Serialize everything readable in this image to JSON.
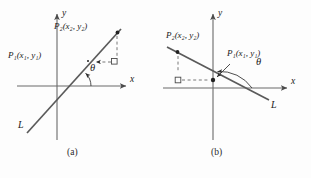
{
  "figure": {
    "background": "#fdfdfd",
    "stroke_color": "#5a5a5a",
    "text_color": "#1a1a1a",
    "width": 311,
    "height": 178
  },
  "panels": [
    {
      "id": "a",
      "caption": "(a)",
      "caption_pos": [
        74,
        152
      ],
      "description": "Line L with positive slope rising left to right; acute angle theta",
      "axes": {
        "x_label": "x",
        "y_label": "y",
        "x_label_pos": [
          131,
          80
        ],
        "y_label_pos": [
          62,
          12
        ],
        "x_axis": [
          17,
          86,
          125,
          86
        ],
        "y_axis": [
          57,
          17,
          57,
          140
        ],
        "origin": [
          57,
          86
        ]
      },
      "line": {
        "name": "L",
        "label": "L",
        "label_pos": [
          20,
          125
        ],
        "p_start": [
          27,
          133
        ],
        "p_end": [
          120,
          30
        ],
        "slope_sign": "positive"
      },
      "points": [
        {
          "name": "P1",
          "label_main": "P",
          "label_sub": "1",
          "label_args": "(x₁, y₁)",
          "label_text": "P₁(x₁, y₁)",
          "label_pos": [
            9,
            55
          ],
          "dot": [
            86,
            62
          ]
        },
        {
          "name": "P2",
          "label_main": "P",
          "label_sub": "2",
          "label_args": "(x₂, y₂)",
          "label_text": "P₂(x₂, y₂)",
          "label_pos": [
            56,
            27
          ],
          "dot": [
            117,
            33
          ]
        }
      ],
      "angle": {
        "symbol": "θ",
        "label_pos": [
          93,
          68
        ],
        "vertex": [
          73,
          86
        ],
        "type": "acute",
        "from_deg": 0,
        "to_deg": 48
      },
      "right_angle_marker": {
        "pos": [
          114,
          59
        ],
        "size": 5
      },
      "dashed": {
        "vertical": [
          117,
          36,
          117,
          56
        ],
        "horizontal": [
          93,
          62,
          111,
          62
        ],
        "arrow_at": "P1"
      }
    },
    {
      "id": "b",
      "caption": "(b)",
      "caption_pos": [
        218,
        152
      ],
      "description": "Line L with negative slope falling left to right; obtuse angle theta",
      "axes": {
        "x_label": "x",
        "y_label": "y",
        "x_label_pos": [
          291,
          82
        ],
        "y_label_pos": [
          218,
          12
        ],
        "x_axis": [
          163,
          88,
          285,
          88
        ],
        "y_axis": [
          213,
          17,
          213,
          140
        ],
        "origin": [
          213,
          88
        ]
      },
      "line": {
        "name": "L",
        "label": "L",
        "label_pos": [
          272,
          105
        ],
        "p_start": [
          168,
          47
        ],
        "p_end": [
          268,
          99
        ],
        "slope_sign": "negative"
      },
      "points": [
        {
          "name": "P2",
          "label_main": "P",
          "label_sub": "2",
          "label_args": "(x₂, y₂)",
          "label_text": "P₂(x₂, y₂)",
          "label_pos": [
            169,
            35
          ],
          "dot": [
            178,
            52
          ]
        },
        {
          "name": "P1",
          "label_main": "P",
          "label_sub": "1",
          "label_args": "(x₁, y₁)",
          "label_text": "P₁(x₁, y₁)",
          "label_pos": [
            228,
            54
          ],
          "dot": [
            213,
            80
          ]
        }
      ],
      "angle": {
        "symbol": "θ",
        "label_pos": [
          257,
          62
        ],
        "vertex": [
          213,
          88
        ],
        "type": "obtuse",
        "from_deg": 0,
        "to_deg": 152
      },
      "right_angle_marker": {
        "pos": [
          175,
          74
        ],
        "size": 5
      },
      "dashed": {
        "vertical": [
          178,
          56,
          178,
          72
        ],
        "horizontal": [
          182,
          80,
          209,
          80
        ],
        "arrow_at": "P1"
      }
    }
  ]
}
